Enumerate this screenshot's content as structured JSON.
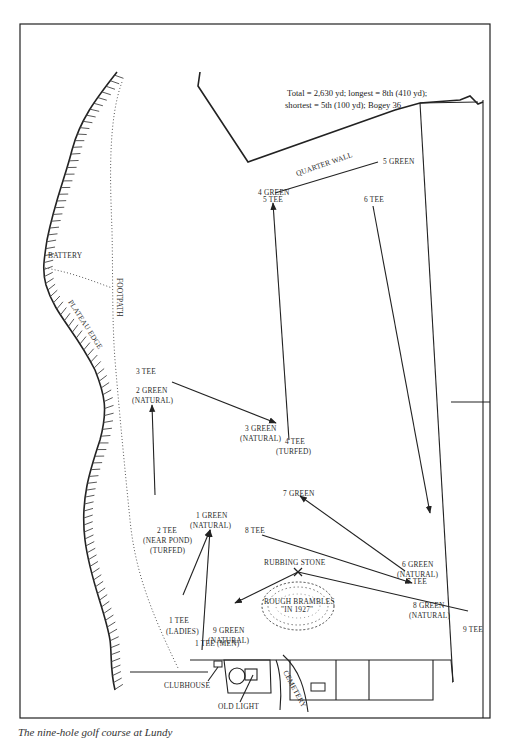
{
  "stats": {
    "line1": "Total = 2,630 yd; longest = 8th (410 yd);",
    "line2": "shortest = 5th (100 yd); Bogey 36"
  },
  "landmarks": {
    "quarter_wall": "QUARTER WALL",
    "footpath": "FOOTPATH",
    "battery": "BATTERY",
    "plateau_edge": "PLATEAU EDGE",
    "rubbing_stone": "RUBBING STONE",
    "rough_brambles_1": "ROUGH BRAMBLES",
    "rough_brambles_2": "\"IN 1927\"",
    "clubhouse": "CLUBHOUSE",
    "old_light": "OLD LIGHT",
    "cemetery": "CEMETERY"
  },
  "holes": {
    "tee1_ladies": {
      "line1": "1  TEE",
      "line2": "(LADIES)"
    },
    "tee1_men": {
      "line1": "1 TEE (MEN)"
    },
    "green1": {
      "line1": "1 GREEN",
      "line2": "(NATURAL)"
    },
    "tee2": {
      "line1": "2  TEE",
      "line2": "(NEAR POND)",
      "line3": "(TURFED)"
    },
    "green2": {
      "line1": "2 GREEN",
      "line2": "(NATURAL)"
    },
    "tee3": {
      "line1": "3 TEE"
    },
    "green3": {
      "line1": "3 GREEN",
      "line2": "(NATURAL)"
    },
    "tee4": {
      "line1": "4 TEE",
      "line2": "(TURFED)"
    },
    "green4": {
      "line1": "4 GREEN"
    },
    "tee5": {
      "line1": "5 TEE"
    },
    "green5": {
      "line1": "5 GREEN"
    },
    "tee6": {
      "line1": "6 TEE"
    },
    "green6": {
      "line1": "6 GREEN",
      "line2": "(NATURAL)"
    },
    "tee7": {
      "line1": "7 TEE"
    },
    "green7": {
      "line1": "7 GREEN"
    },
    "tee8": {
      "line1": "8 TEE"
    },
    "green8": {
      "line1": "8 GREEN",
      "line2": "(NATURAL)"
    },
    "tee9": {
      "line1": "9 TEE"
    },
    "green9": {
      "line1": "9 GREEN",
      "line2": "(NATURAL)"
    }
  },
  "caption": "The nine-hole golf course at Lundy"
}
